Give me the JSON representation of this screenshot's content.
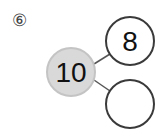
{
  "problem": {
    "label": "⑥",
    "whole": "10",
    "parts": [
      "8",
      ""
    ]
  },
  "colors": {
    "whole_fill": "#d9d9d9",
    "whole_stroke": "#c4c4c4",
    "part_stroke": "#3a3a3a",
    "line": "#555555"
  }
}
